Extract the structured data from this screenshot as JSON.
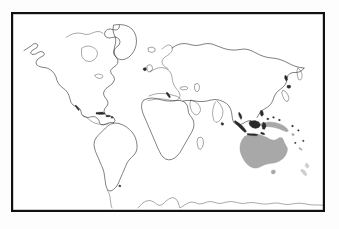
{
  "figure": {
    "kind": "world-map",
    "background_color": "#fdfdfd",
    "map_background_color": "#ffffff",
    "frame_color": "#111111",
    "coastline_color": "#1a1a1a",
    "highlight_color": "#a8a8a8",
    "highlight_secondary_color": "#cfcfcf",
    "projection": "cylindrical",
    "labels": [],
    "legend": [],
    "highlighted_regions": [
      {
        "name": "Australia",
        "color": "#a8a8a8"
      },
      {
        "name": "New Guinea",
        "color": "#a8a8a8"
      },
      {
        "name": "Tasmania",
        "color": "#a8a8a8"
      },
      {
        "name": "New Zealand",
        "color": "#cfcfcf"
      }
    ],
    "regions": [
      {
        "name": "North America"
      },
      {
        "name": "Greenland"
      },
      {
        "name": "South America"
      },
      {
        "name": "Africa"
      },
      {
        "name": "Europe"
      },
      {
        "name": "Asia"
      },
      {
        "name": "Indonesia"
      },
      {
        "name": "Japan"
      },
      {
        "name": "Madagascar"
      },
      {
        "name": "Antarctica"
      },
      {
        "name": "Iceland"
      },
      {
        "name": "British Isles"
      },
      {
        "name": "Sri Lanka"
      },
      {
        "name": "Philippines"
      }
    ]
  }
}
